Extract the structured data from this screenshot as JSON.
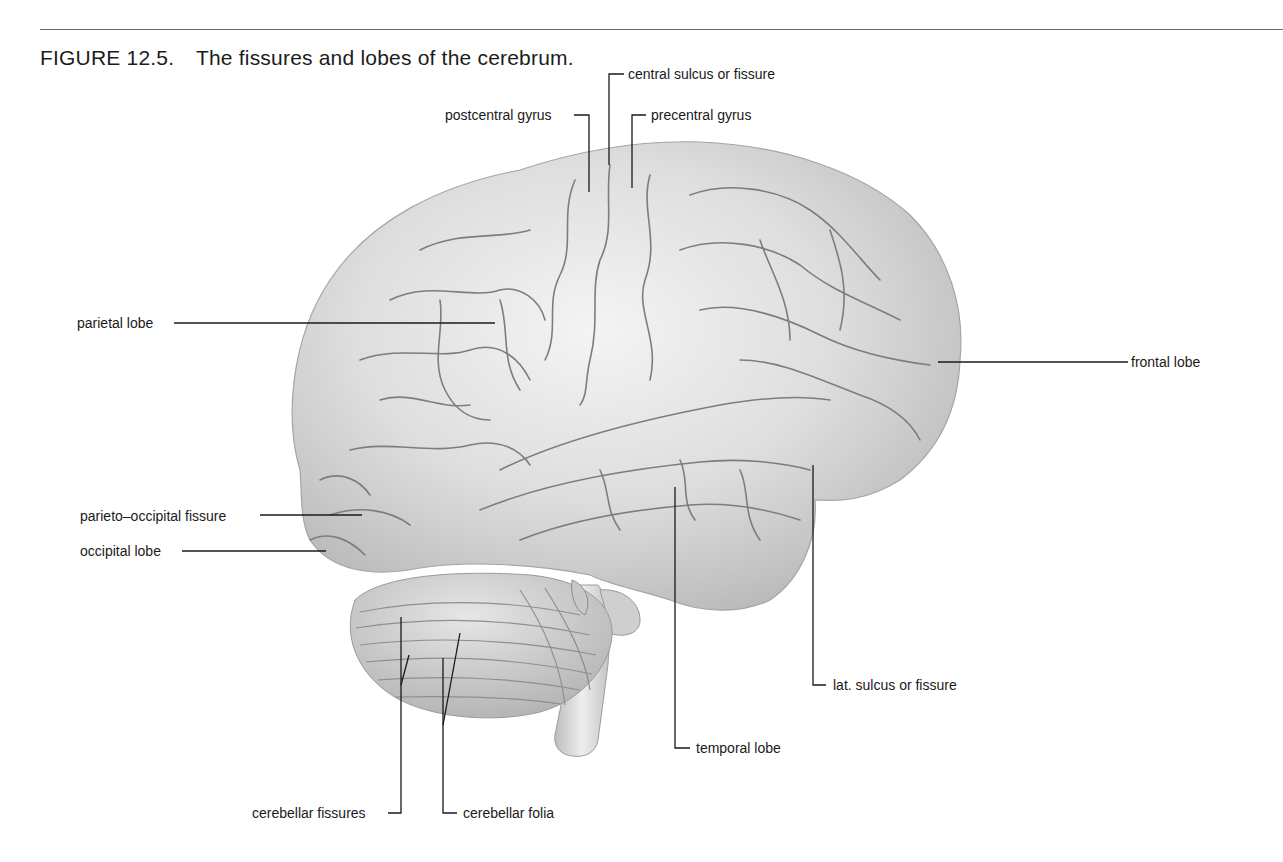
{
  "figure": {
    "number": "FIGURE 12.5.",
    "title": "The fissures and lobes of the cerebrum."
  },
  "illustration": {
    "subject": "lateral view of the human brain",
    "icon": "brain-illustration"
  },
  "labels": {
    "central_sulcus": "central sulcus or fissure",
    "postcentral_gyrus": "postcentral gyrus",
    "precentral_gyrus": "precentral gyrus",
    "parietal_lobe": "parietal lobe",
    "frontal_lobe": "frontal lobe",
    "parieto_occipital_fissure": "parieto–occipital fissure",
    "occipital_lobe": "occipital lobe",
    "lat_sulcus": "lat. sulcus or fissure",
    "temporal_lobe": "temporal lobe",
    "cerebellar_fissures": "cerebellar fissures",
    "cerebellar_folia": "cerebellar folia"
  }
}
